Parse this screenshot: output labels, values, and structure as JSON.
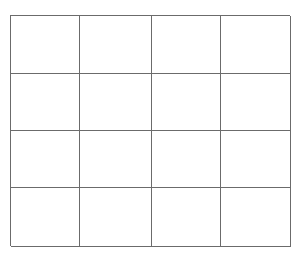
{
  "grid": {
    "rows": 4,
    "columns": 4,
    "line_color": "#6b6b6b",
    "background_color": "#ffffff",
    "cells": [
      [
        "",
        "",
        "",
        ""
      ],
      [
        "",
        "",
        "",
        ""
      ],
      [
        "",
        "",
        "",
        ""
      ],
      [
        "",
        "",
        "",
        ""
      ]
    ]
  }
}
